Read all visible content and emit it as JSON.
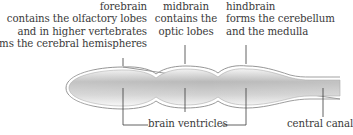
{
  "labels": {
    "forebrain": {
      "title": "forebrain",
      "lines": [
        "contains the olfactory lobes",
        "and in higher vertebrates",
        "forms the cerebral hemispheres"
      ]
    },
    "midbrain": {
      "title": "midbrain",
      "lines": [
        "contains the",
        "optic lobes"
      ]
    },
    "hindbrain": {
      "title": "hindbrain",
      "lines": [
        "forms the cerebellum",
        "and the medulla"
      ]
    },
    "brain_ventricles": "brain ventricles",
    "central_canal": "central canal"
  },
  "colors": {
    "outline": "#8a8a8a",
    "fill_dark": "#b5b5b5",
    "fill_light": "#f2f2f2",
    "text": "#3a3a3a",
    "leader": "#3a3a3a"
  }
}
